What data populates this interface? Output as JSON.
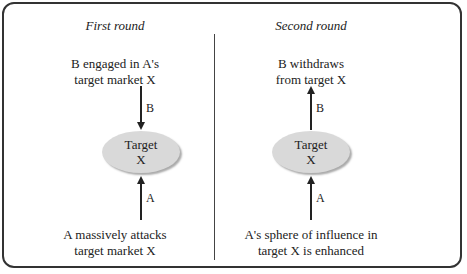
{
  "diagram": {
    "panels": [
      {
        "title": "First round",
        "top_text": [
          "B engaged in A's",
          "target market X"
        ],
        "arrow_b_label": "B",
        "arrow_b_direction": "down",
        "node": [
          "Target",
          "X"
        ],
        "arrow_a_label": "A",
        "arrow_a_direction": "up",
        "bottom_text": [
          "A massively attacks",
          "target market X"
        ]
      },
      {
        "title": "Second round",
        "top_text": [
          "B withdraws",
          "from target X"
        ],
        "arrow_b_label": "B",
        "arrow_b_direction": "up",
        "node": [
          "Target",
          "X"
        ],
        "arrow_a_label": "A",
        "arrow_a_direction": "up",
        "bottom_text": [
          "A's sphere of influence in",
          "target X is enhanced"
        ]
      }
    ],
    "colors": {
      "node_fill": "#d9d9d9",
      "border": "#333333"
    }
  }
}
